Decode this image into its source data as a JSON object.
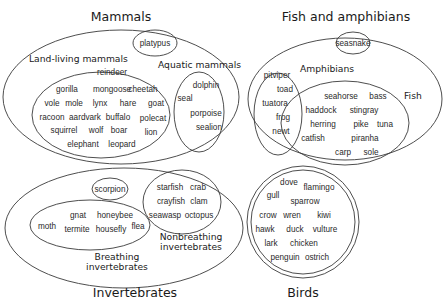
{
  "groups": {
    "mammals": {
      "title": "Mammals",
      "platypus": "platypus",
      "land": {
        "label": "Land-living mammals",
        "items": [
          "reindeer",
          "gorilla",
          "mongoose",
          "cheetah",
          "vole",
          "mole",
          "lynx",
          "hare",
          "goat",
          "racoon",
          "aardvark",
          "buffalo",
          "polecat",
          "squirrel",
          "wolf",
          "boar",
          "lion",
          "elephant",
          "leopard"
        ]
      },
      "aquatic": {
        "label": "Aquatic mammals",
        "items": [
          "dolphin",
          "seal",
          "porpoise",
          "sealion"
        ]
      }
    },
    "fish_amphibians": {
      "title": "Fish and amphibians",
      "seasnake": "seasnake",
      "amphibians": {
        "label": "Amphibians",
        "items": [
          "pitviper",
          "toad",
          "tuatora",
          "frog",
          "newt"
        ]
      },
      "fish": {
        "label": "Fish",
        "items": [
          "seahorse",
          "bass",
          "haddock",
          "stingray",
          "herring",
          "pike",
          "tuna",
          "catfish",
          "piranha",
          "carp",
          "sole"
        ]
      }
    },
    "invertebrates": {
      "title": "Invertebrates",
      "scorpion": "scorpion",
      "breathing": {
        "label_line1": "Breathing",
        "label_line2": "invertebrates",
        "items": [
          "moth",
          "gnat",
          "honeybee",
          "termite",
          "housefly",
          "flea"
        ]
      },
      "nonbreathing": {
        "label_line1": "Nonbreathing",
        "label_line2": "invertebrates",
        "items": [
          "starfish",
          "crab",
          "crayfish",
          "clam",
          "seawasp",
          "octopus"
        ]
      }
    },
    "birds": {
      "title": "Birds",
      "items": [
        "dove",
        "flamingo",
        "gull",
        "sparrow",
        "crow",
        "wren",
        "kiwi",
        "hawk",
        "duck",
        "vulture",
        "lark",
        "chicken",
        "penguin",
        "ostrich"
      ]
    }
  }
}
